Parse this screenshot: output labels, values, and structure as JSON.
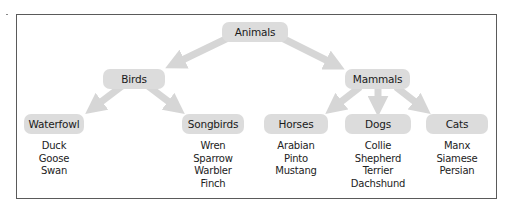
{
  "diagram": {
    "type": "tree",
    "root": {
      "label": "Animals"
    },
    "level1": [
      {
        "label": "Birds"
      },
      {
        "label": "Mammals"
      }
    ],
    "level2": [
      {
        "label": "Waterfowl",
        "parent": "Birds",
        "items": [
          "Duck",
          "Goose",
          "Swan"
        ]
      },
      {
        "label": "Songbirds",
        "parent": "Birds",
        "items": [
          "Wren",
          "Sparrow",
          "Warbler",
          "Finch"
        ]
      },
      {
        "label": "Horses",
        "parent": "Mammals",
        "items": [
          "Arabian",
          "Pinto",
          "Mustang"
        ]
      },
      {
        "label": "Dogs",
        "parent": "Mammals",
        "items": [
          "Collie",
          "Shepherd",
          "Terrier",
          "Dachshund"
        ]
      },
      {
        "label": "Cats",
        "parent": "Mammals",
        "items": [
          "Manx",
          "Siamese",
          "Persian"
        ]
      }
    ],
    "colors": {
      "node_fill": "#dcdcdc",
      "arrow": "#d6d6d6",
      "frame_border": "#5a5a5a",
      "text": "#1e1e1e"
    }
  }
}
